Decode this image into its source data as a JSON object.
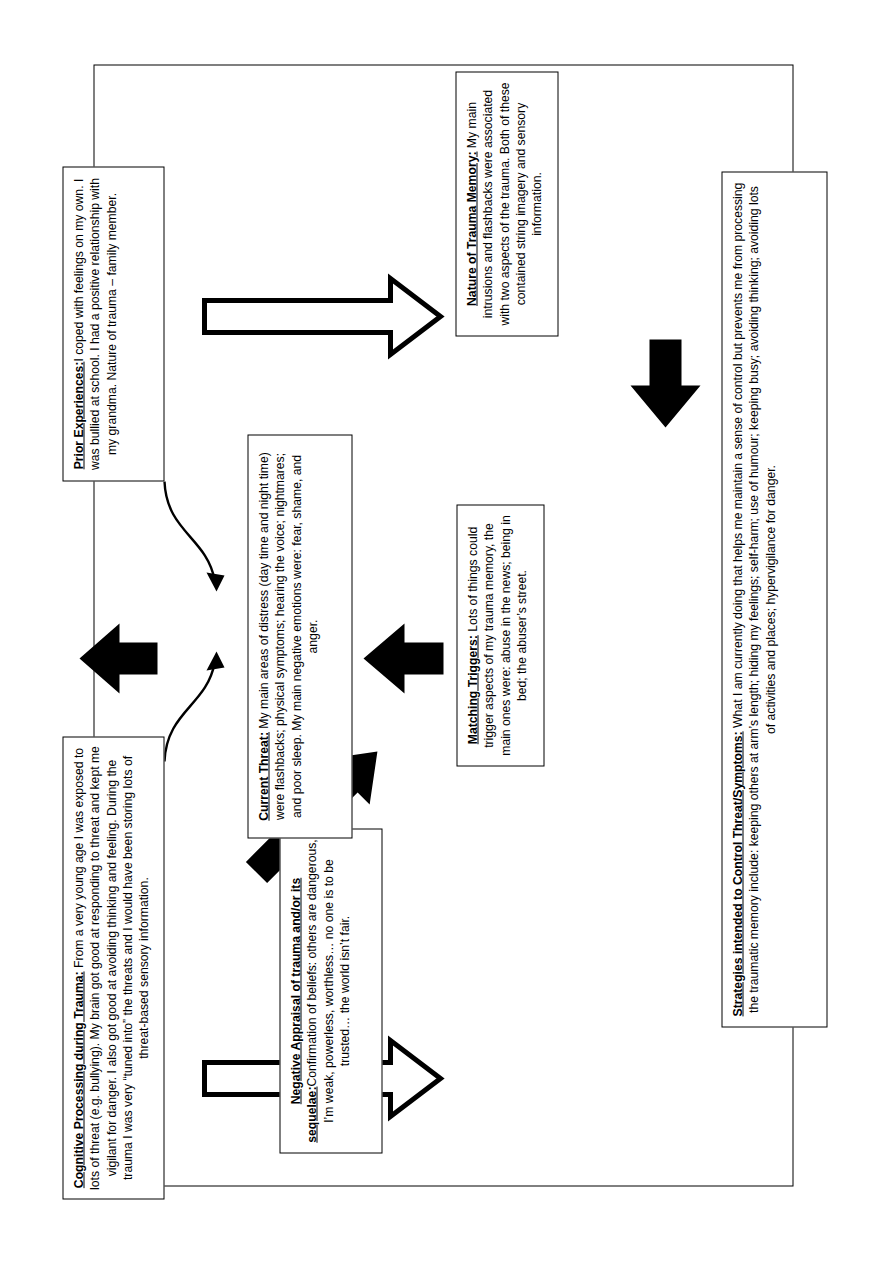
{
  "diagram": {
    "type": "ptsd-cognitive-model-formulation",
    "orientation": "rotated-90-counterclockwise",
    "boxes": {
      "cognitive_processing": {
        "title": "Cognitive Processing during Trauma:",
        "body": " From a very young age I was exposed to lots of threat (e.g. bullying). My brain got good at responding to threat and kept me vigilant for danger. I also got good at avoiding thinking and feeling. During the trauma I was very “tuned into” the threats and I would have been storing lots of threat-based sensory information."
      },
      "prior_experiences": {
        "title": "Prior Experiences:",
        "body": "I coped with feelings on my own. I was bullied at school. I had a positive relationship with my grandma. Nature of trauma – family member."
      },
      "negative_appraisal": {
        "title": "Negative Appraisal of trauma and/or its sequelae:",
        "body": "Confirmation of beliefs: others are dangerous, I’m weak, powerless, worthless… no one is to be trusted… the world isn’t fair."
      },
      "matching_triggers": {
        "title": "Matching Triggers:",
        "body": " Lots of things could trigger aspects of my trauma memory, the main ones were: abuse in the news; being in bed; the abuser’s street."
      },
      "nature_of_trauma_memory": {
        "title": "Nature of Trauma Memory:",
        "body": " My main intrusions and flashbacks were associated with two aspects of the trauma. Both of these contained string imagery and sensory information."
      },
      "current_threat": {
        "title": "Current Threat:",
        "body": " My main areas of distress (day time and night time) were flashbacks; physical symptoms; hearing the voice; nightmares; and poor sleep. My main negative emotions were: fear, shame, and anger."
      },
      "strategies": {
        "title": "Strategies intended to Control Threat/Symptoms:",
        "body": " What I am currently doing that helps me maintain a sense of control but prevents me from processing the traumatic memory include: keeping others at arm’s length; hiding my feelings; self-harm; use of humour; keeping busy; avoiding thinking; avoiding lots of activities and places; hypervigilance for danger."
      }
    },
    "arrows": [
      {
        "name": "cognitive-processing-to-cycle",
        "style": "thin-curved",
        "direction": "down-right",
        "from": "cognitive_processing",
        "to": "cycle_container"
      },
      {
        "name": "prior-experiences-to-cycle",
        "style": "thin-curved",
        "direction": "up-right",
        "from": "prior_experiences",
        "to": "cycle_container"
      },
      {
        "name": "negative-appraisal-to-current-threat",
        "style": "solid-block",
        "direction": "down-right",
        "from": "negative_appraisal",
        "to": "current_threat"
      },
      {
        "name": "matching-triggers-to-current-threat",
        "style": "solid-block",
        "direction": "right",
        "from": "matching_triggers",
        "to": "current_threat"
      },
      {
        "name": "nature-of-trauma-memory-to-matching-triggers",
        "style": "solid-block",
        "direction": "up",
        "from": "nature_of_trauma_memory",
        "to": "matching_triggers"
      },
      {
        "name": "current-threat-to-strategies",
        "style": "solid-block",
        "direction": "right",
        "from": "current_threat",
        "to": "strategies"
      },
      {
        "name": "strategies-to-negative-appraisal",
        "style": "hollow-block",
        "direction": "left",
        "from": "strategies",
        "to": "negative_appraisal"
      },
      {
        "name": "strategies-to-nature-of-trauma-memory",
        "style": "hollow-block",
        "direction": "left",
        "from": "strategies",
        "to": "nature_of_trauma_memory"
      }
    ],
    "colors": {
      "stroke": "#000000",
      "fill": "#ffffff",
      "page": "#ffffff"
    }
  }
}
